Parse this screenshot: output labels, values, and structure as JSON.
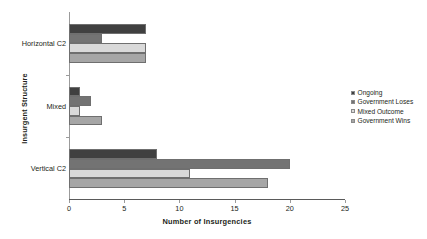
{
  "chart_data": {
    "type": "bar",
    "orientation": "horizontal",
    "title": "",
    "xlabel": "Number of Insurgencies",
    "ylabel": "Insurgent Structure",
    "categories": [
      "Horizontal C2",
      "Mixed",
      "Vertical C2"
    ],
    "series": [
      {
        "name": "Ongoing",
        "color": "#404040",
        "values": [
          7,
          1,
          8
        ]
      },
      {
        "name": "Government Loses",
        "color": "#737373",
        "values": [
          3,
          2,
          20
        ]
      },
      {
        "name": "Mixed Outcome",
        "color": "#d9d9d9",
        "values": [
          7,
          1,
          11
        ]
      },
      {
        "name": "Government Wins",
        "color": "#a6a6a6",
        "values": [
          7,
          3,
          18
        ]
      }
    ],
    "xlim": [
      0,
      25
    ],
    "xticks": [
      0,
      5,
      10,
      15,
      20,
      25
    ],
    "xtick_labels": [
      "0",
      "5",
      "10",
      "15",
      "20",
      "25"
    ],
    "grid": false,
    "legend_position": "right"
  },
  "colors": {
    "axis_line": "#9b9b9b",
    "baseline": "#5a5a5a",
    "text": "#231f20",
    "background": "#ffffff"
  }
}
